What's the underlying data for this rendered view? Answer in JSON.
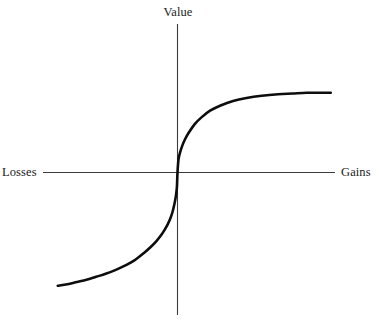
{
  "figure": {
    "caption_visible": false,
    "background_color": "#ffffff",
    "width": 379,
    "height": 320,
    "residue_top_left": "y",
    "residue_top_right": "p"
  },
  "labels": {
    "value": "Value",
    "losses": "Losses",
    "gains": "Gains"
  },
  "chart_data": {
    "type": "line",
    "title": "",
    "subtitle": "",
    "xlabel": "Losses – Gains",
    "ylabel": "Value",
    "axis_labels": {
      "y_axis_top": "Value",
      "x_axis_left": "Losses",
      "x_axis_right": "Gains"
    },
    "grid": false,
    "legend": null,
    "legend_position": "none",
    "axes": {
      "origin_px": [
        177,
        172
      ],
      "x_axis_px": {
        "x_start": 43,
        "x_end": 335,
        "y": 172
      },
      "y_axis_px": {
        "y_start": 24,
        "y_end": 315,
        "x": 177
      },
      "axis_color": "#3c3c3c",
      "axis_width_px": 1.1,
      "ticks": [],
      "tick_labels": []
    },
    "xlim": [
      -1.25,
      1.6
    ],
    "ylim": [
      -1.55,
      1.1
    ],
    "curve": {
      "name": "Prospect theory value function",
      "color": "#0d0d0d",
      "width_px": 2.6,
      "description": "S-shaped value function: concave for gains, convex for losses, steeper for losses than gains (loss aversion), kinked at the reference point (origin).",
      "gains_branch": "v(x) = x^0.5 for x >= 0 (concave, diminishing sensitivity)",
      "losses_branch": "v(x) = -2.25 * (-x)^0.5 for x < 0 (convex, steeper slope)",
      "x": [
        -1.25,
        -1.15,
        -1.05,
        -0.95,
        -0.85,
        -0.75,
        -0.65,
        -0.55,
        -0.45,
        -0.35,
        -0.28,
        -0.22,
        -0.17,
        -0.13,
        -0.1,
        -0.07,
        -0.05,
        -0.03,
        -0.015,
        -0.006,
        0,
        0.01,
        0.025,
        0.05,
        0.08,
        0.12,
        0.18,
        0.25,
        0.34,
        0.45,
        0.58,
        0.72,
        0.88,
        1.05,
        1.2,
        1.35,
        1.48,
        1.6
      ],
      "y": [
        -1.52,
        -1.5,
        -1.47,
        -1.44,
        -1.4,
        -1.36,
        -1.31,
        -1.25,
        -1.18,
        -1.08,
        -1.0,
        -0.92,
        -0.84,
        -0.76,
        -0.69,
        -0.6,
        -0.52,
        -0.41,
        -0.3,
        -0.19,
        0,
        0.17,
        0.26,
        0.36,
        0.45,
        0.54,
        0.65,
        0.74,
        0.83,
        0.9,
        0.96,
        1.0,
        1.03,
        1.05,
        1.06,
        1.07,
        1.07,
        1.07
      ],
      "endpoints_px": {
        "left": [
          57,
          293
        ],
        "right": [
          330,
          100
        ]
      },
      "reference_point": [
        0,
        0
      ]
    }
  }
}
